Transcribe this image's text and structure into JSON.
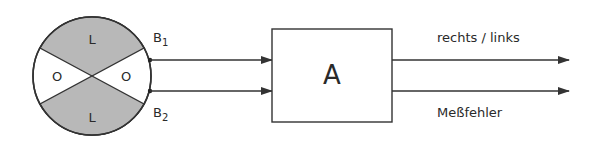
{
  "colors": {
    "stroke": "#333333",
    "shaded": "#b8b8b8",
    "background": "#ffffff",
    "text": "#2a2a2a"
  },
  "sensor": {
    "sector_top_label": "L",
    "sector_bottom_label": "L",
    "sector_left_label": "O",
    "sector_right_label": "O",
    "terminal_1_label": "B",
    "terminal_1_sub": "1",
    "terminal_2_label": "B",
    "terminal_2_sub": "2"
  },
  "block": {
    "label": "A"
  },
  "outputs": [
    {
      "label": "rechts / links"
    },
    {
      "label": "Meßfehler"
    }
  ]
}
